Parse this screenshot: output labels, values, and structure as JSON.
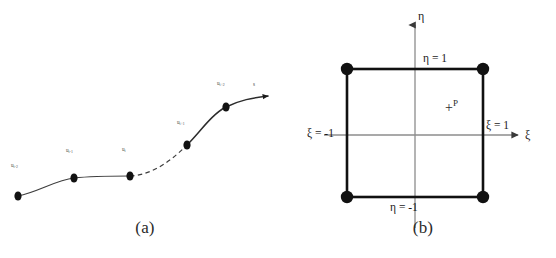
{
  "figure": {
    "background_color": "#ffffff",
    "ink_color": "#111111",
    "width": 556,
    "height": 258
  },
  "panel_a": {
    "caption": "(a)",
    "description": "curved line element with five nodes and a dashed middle segment terminating in an arrow",
    "curve_color": "#3a3a3a",
    "node_color": "#111111",
    "nodes": [
      {
        "id": "n1",
        "label": "u",
        "sub": "i-2",
        "x": 18,
        "y": 196,
        "label_x": 11,
        "label_y": 163
      },
      {
        "id": "n2",
        "label": "u",
        "sub": "i-1",
        "x": 74,
        "y": 178,
        "label_x": 66,
        "label_y": 148
      },
      {
        "id": "n3",
        "label": "u",
        "sub": "i",
        "x": 130,
        "y": 176,
        "label_x": 122,
        "label_y": 147
      },
      {
        "id": "n4",
        "label": "u",
        "sub": "i+1",
        "x": 187,
        "y": 145,
        "label_x": 177,
        "label_y": 120
      },
      {
        "id": "n5",
        "label": "u",
        "sub": "i+2",
        "x": 226,
        "y": 107,
        "label_x": 217,
        "label_y": 81
      }
    ],
    "arrow_label": {
      "label": "s",
      "x": 253,
      "y": 82
    },
    "dashed_segment": {
      "from_node": "n3",
      "to_node": "n4"
    }
  },
  "panel_b": {
    "caption": "(b)",
    "description": "parent square element in natural coordinates with four corner nodes and point P",
    "square": {
      "left": 347,
      "right": 483,
      "top": 69,
      "bottom": 197
    },
    "corner_nodes": [
      {
        "id": "c-top-left",
        "x": 347,
        "y": 69
      },
      {
        "id": "c-top-right",
        "x": 483,
        "y": 69
      },
      {
        "id": "c-bottom-left",
        "x": 347,
        "y": 197
      },
      {
        "id": "c-bottom-right",
        "x": 483,
        "y": 197
      }
    ],
    "axes": {
      "vertical_label": "η",
      "horizontal_label": "ξ",
      "origin": {
        "x": 415,
        "y": 135
      }
    },
    "edge_labels": {
      "eta_top": "η = 1",
      "eta_bottom": "η = -1",
      "xi_left": "ξ = -1",
      "xi_right": "ξ = 1"
    },
    "point": {
      "marker": "+",
      "label": "P",
      "x": 452,
      "y": 108
    }
  }
}
